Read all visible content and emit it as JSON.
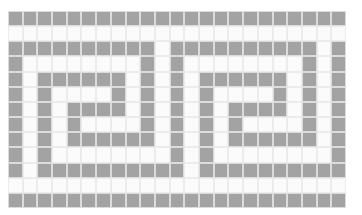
{
  "grid": {
    "columns": 23,
    "rows": 13,
    "colors": {
      "filled": "#a3a3a3",
      "empty": "#fbfbfb",
      "grout": "#e6e6e6"
    },
    "motif_period": 11,
    "motif_rows": [
      "GGGGGGGGGGG",
      "WWWWWWWWWWW",
      "GGGGGGGGGGW",
      "GWWWWWWWWGW",
      "GWGGGGGGWGW",
      "GWGWWWWGWGW",
      "GWGWGGGGWGW",
      "GWGWGWWWWGW",
      "GWGWGGGGGGW",
      "GWGWWWWWWWW",
      "GWGGGGGGGGG",
      "WWWWWWWWWWW",
      "GGGGGGGGGGG"
    ]
  }
}
